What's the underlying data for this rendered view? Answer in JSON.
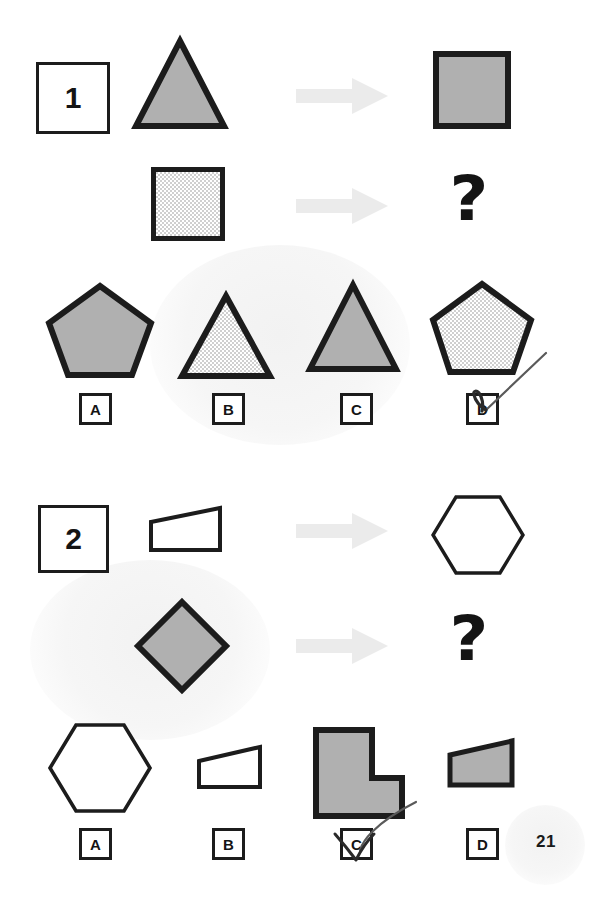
{
  "document": {
    "page_number": "21",
    "watermarks": [
      "",
      ""
    ]
  },
  "colors": {
    "ink": "#1c1c1c",
    "shape_fill_gray": "#b0b0b0",
    "shape_fill_white": "#ffffff",
    "dotted_fill": "#e8e8e8",
    "arrow": "#ebebeb",
    "annotation": "#555555",
    "paper": "#ffffff"
  },
  "puzzles": [
    {
      "id": "puzzle-1",
      "number": "1",
      "prompt_row": {
        "source_shape": {
          "name": "triangle",
          "fill": "gray",
          "label": "triangle"
        },
        "arrow": {
          "name": "right-arrow",
          "label": "becomes"
        },
        "result_shape": {
          "name": "square",
          "fill": "gray",
          "label": "square"
        }
      },
      "question_row": {
        "source_shape": {
          "name": "square",
          "fill": "dotted",
          "label": "dotted square"
        },
        "arrow": {
          "name": "right-arrow",
          "label": "becomes"
        },
        "result_shape": {
          "name": "question-mark",
          "fill": "none",
          "label": "?"
        }
      },
      "options": [
        {
          "letter": "A",
          "shape": "pentagon",
          "fill": "gray",
          "selected": false
        },
        {
          "letter": "B",
          "shape": "triangle",
          "fill": "dotted",
          "selected": false
        },
        {
          "letter": "C",
          "shape": "triangle",
          "fill": "gray",
          "selected": false
        },
        {
          "letter": "D",
          "shape": "pentagon",
          "fill": "dotted",
          "selected": true
        }
      ],
      "marked_answer": "D"
    },
    {
      "id": "puzzle-2",
      "number": "2",
      "prompt_row": {
        "source_shape": {
          "name": "trapezoid",
          "fill": "white",
          "label": "trapezoid"
        },
        "arrow": {
          "name": "right-arrow",
          "label": "becomes"
        },
        "result_shape": {
          "name": "hexagon",
          "fill": "white",
          "label": "hexagon"
        }
      },
      "question_row": {
        "source_shape": {
          "name": "diamond",
          "fill": "gray",
          "label": "gray diamond"
        },
        "arrow": {
          "name": "right-arrow",
          "label": "becomes"
        },
        "result_shape": {
          "name": "question-mark",
          "fill": "none",
          "label": "?"
        }
      },
      "options": [
        {
          "letter": "A",
          "shape": "hexagon",
          "fill": "white",
          "selected": false
        },
        {
          "letter": "B",
          "shape": "trapezoid",
          "fill": "white",
          "selected": false
        },
        {
          "letter": "C",
          "shape": "l-shape",
          "fill": "gray",
          "selected": true
        },
        {
          "letter": "D",
          "shape": "trapezoid",
          "fill": "gray",
          "selected": false
        }
      ],
      "marked_answer": "C"
    }
  ]
}
